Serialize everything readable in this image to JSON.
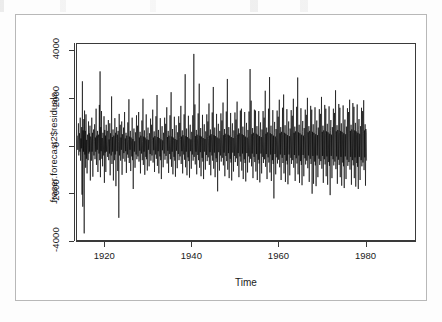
{
  "figure": {
    "background_color": "#ffffff",
    "page_color": "#fdfdfd",
    "border_color": "#b8b8b8",
    "axis_color": "#3a3a3a",
    "series_color": "#000000"
  },
  "chart_data": {
    "type": "line",
    "title": "",
    "subtitle": "",
    "xlabel": "Time",
    "ylabel": "fraser.forecast2$residuals",
    "xlim": [
      1913.5,
      1991.6
    ],
    "ylim": [
      -4000,
      4300
    ],
    "grid": false,
    "legend": null,
    "legend_position": "none",
    "x_ticks": [
      1920,
      1940,
      1960,
      1980
    ],
    "x_tick_labels": [
      "1920",
      "1940",
      "1960",
      "1980"
    ],
    "y_ticks": [
      -4000,
      -2000,
      0,
      2000,
      4000
    ],
    "y_tick_labels": [
      "-4000",
      "-2000",
      "0",
      "2000",
      "4000"
    ],
    "series_name": "fraser.forecast2$residuals",
    "n_points": 938,
    "sampling": "monthly",
    "x_start": 1913.58,
    "x_step": 0.08333,
    "values": [
      420,
      -180,
      260,
      940,
      -420,
      180,
      520,
      -260,
      1180,
      -640,
      300,
      -120,
      780,
      -2080,
      2720,
      -2590,
      640,
      -260,
      1120,
      -3720,
      1480,
      -380,
      620,
      -940,
      1320,
      -560,
      240,
      -1180,
      460,
      180,
      -620,
      1020,
      -340,
      520,
      -260,
      840,
      -1480,
      380,
      220,
      -640,
      1180,
      -260,
      540,
      -1320,
      300,
      680,
      -420,
      160,
      900,
      -580,
      340,
      -260,
      1560,
      -820,
      420,
      -180,
      620,
      -1120,
      280,
      460,
      -340,
      1720,
      -620,
      3140,
      -1340,
      780,
      -240,
      1460,
      -560,
      320,
      -880,
      540,
      200,
      -420,
      1240,
      -1580,
      660,
      -300,
      420,
      -1120,
      880,
      -260,
      340,
      620,
      -480,
      180,
      1080,
      -620,
      260,
      -340,
      940,
      -1260,
      520,
      180,
      -420,
      2080,
      -780,
      360,
      -260,
      680,
      -1480,
      420,
      240,
      -620,
      1160,
      -380,
      540,
      -1720,
      300,
      780,
      -240,
      460,
      -1080,
      620,
      180,
      -3060,
      1340,
      -420,
      260,
      880,
      -640,
      340,
      -180,
      1020,
      -1240,
      480,
      220,
      -560,
      760,
      -320,
      180,
      1420,
      -680,
      300,
      -240,
      540,
      -1160,
      420,
      160,
      -380,
      980,
      -520,
      260,
      1960,
      -740,
      380,
      -180,
      620,
      -1080,
      340,
      220,
      -460,
      1180,
      -620,
      280,
      -1840,
      440,
      720,
      -260,
      180,
      -940,
      560,
      240,
      -380,
      1280,
      -580,
      320,
      840,
      -460,
      200,
      1420,
      -680,
      340,
      -220,
      580,
      -1180,
      420,
      260,
      -340,
      1060,
      -620,
      180,
      1980,
      -820,
      380,
      -260,
      640,
      -1240,
      340,
      200,
      -480,
      1320,
      -580,
      260,
      -1060,
      420,
      760,
      -180,
      240,
      -880,
      520,
      180,
      -360,
      1140,
      -640,
      300,
      880,
      -420,
      220,
      1520,
      -720,
      340,
      -200,
      600,
      -1120,
      400,
      240,
      -380,
      1240,
      -560,
      280,
      2140,
      -860,
      360,
      -240,
      660,
      -1180,
      320,
      200,
      -460,
      1160,
      -620,
      260,
      -1420,
      400,
      820,
      -200,
      220,
      -920,
      540,
      180,
      -340,
      1180,
      -600,
      320,
      920,
      -440,
      240,
      1620,
      -760,
      360,
      -220,
      620,
      -1160,
      420,
      260,
      -360,
      1280,
      -580,
      300,
      2260,
      -900,
      380,
      -260,
      700,
      -1220,
      340,
      220,
      -480,
      1220,
      -640,
      280,
      -1320,
      420,
      860,
      -220,
      240,
      -960,
      560,
      200,
      -360,
      1240,
      -620,
      340,
      960,
      -460,
      260,
      1680,
      -780,
      380,
      -240,
      640,
      -1180,
      440,
      280,
      -380,
      1320,
      -600,
      320,
      3020,
      -920,
      400,
      -260,
      720,
      -1260,
      360,
      240,
      -500,
      1260,
      -660,
      300,
      -1360,
      440,
      880,
      -240,
      260,
      -980,
      580,
      220,
      -380,
      1280,
      -640,
      360,
      3880,
      -480,
      280,
      1740,
      -800,
      400,
      -260,
      660,
      -1220,
      460,
      300,
      -400,
      1360,
      -620,
      340,
      2620,
      -940,
      420,
      -280,
      740,
      -1300,
      380,
      260,
      -520,
      1300,
      -680,
      320,
      -1420,
      460,
      900,
      -260,
      280,
      -1020,
      600,
      240,
      -400,
      1320,
      -660,
      380,
      1020,
      -500,
      300,
      1780,
      -820,
      420,
      -280,
      680,
      -1260,
      480,
      320,
      -420,
      1400,
      -640,
      360,
      2480,
      -980,
      440,
      -300,
      760,
      -1340,
      400,
      280,
      -540,
      1340,
      -700,
      340,
      -1940,
      480,
      920,
      -280,
      300,
      -1060,
      620,
      260,
      -420,
      1360,
      -680,
      400,
      1060,
      -520,
      320,
      1820,
      -840,
      440,
      -300,
      700,
      -1300,
      500,
      340,
      -440,
      1440,
      -660,
      380,
      2820,
      -1020,
      460,
      -320,
      780,
      -1380,
      420,
      300,
      -560,
      1380,
      -720,
      360,
      -1480,
      500,
      940,
      -300,
      320,
      -1100,
      640,
      280,
      -440,
      1400,
      -700,
      420,
      1100,
      -540,
      340,
      1860,
      -860,
      460,
      -320,
      720,
      -1340,
      520,
      360,
      -460,
      1480,
      -680,
      400,
      1560,
      -1060,
      480,
      -340,
      800,
      -1420,
      440,
      320,
      -580,
      1420,
      -740,
      380,
      -1520,
      520,
      960,
      -320,
      340,
      -1140,
      660,
      300,
      -460,
      1440,
      -720,
      440,
      3240,
      -560,
      360,
      1900,
      -880,
      480,
      -340,
      740,
      -1380,
      540,
      380,
      -480,
      1520,
      -700,
      420,
      1480,
      -1100,
      500,
      -360,
      820,
      -1460,
      460,
      340,
      -600,
      1460,
      -760,
      400,
      -1560,
      540,
      980,
      -340,
      360,
      -1180,
      680,
      320,
      -480,
      1460,
      -740,
      460,
      1180,
      -580,
      380,
      2320,
      -900,
      500,
      -360,
      760,
      -1420,
      560,
      400,
      -500,
      1560,
      -720,
      440,
      2900,
      -1140,
      520,
      -380,
      840,
      -1500,
      480,
      360,
      -620,
      1500,
      -780,
      420,
      -2240,
      560,
      1000,
      -360,
      380,
      -1220,
      700,
      340,
      -500,
      1480,
      -760,
      480,
      1220,
      -600,
      400,
      1940,
      -920,
      520,
      -380,
      780,
      -1460,
      580,
      420,
      -520,
      1600,
      -740,
      460,
      2160,
      -1180,
      540,
      -400,
      860,
      -1540,
      500,
      380,
      -640,
      1540,
      -800,
      440,
      -1640,
      580,
      1020,
      -380,
      400,
      -1260,
      720,
      360,
      -520,
      1500,
      -780,
      500,
      1260,
      -620,
      420,
      1980,
      -940,
      540,
      -400,
      800,
      -1500,
      600,
      440,
      -540,
      1640,
      -760,
      480,
      2880,
      -1220,
      560,
      -420,
      880,
      -1580,
      520,
      400,
      -660,
      1580,
      -820,
      460,
      -1680,
      600,
      1040,
      -400,
      420,
      -1300,
      740,
      380,
      -540,
      1520,
      -800,
      520,
      1300,
      -640,
      440,
      2020,
      -960,
      560,
      -420,
      820,
      -1540,
      620,
      460,
      -560,
      1680,
      -780,
      500,
      1520,
      -2040,
      580,
      -440,
      900,
      -1620,
      540,
      420,
      -680,
      1620,
      -840,
      480,
      -1720,
      620,
      1060,
      -420,
      440,
      -1340,
      760,
      400,
      -560,
      1540,
      -820,
      540,
      1340,
      -660,
      460,
      2060,
      -980,
      580,
      -440,
      840,
      -1580,
      640,
      480,
      -580,
      1720,
      -800,
      520,
      1560,
      -1300,
      600,
      -460,
      920,
      -1660,
      560,
      440,
      -700,
      1660,
      -860,
      500,
      -2100,
      640,
      1080,
      -440,
      460,
      -1380,
      780,
      420,
      -580,
      1560,
      -840,
      560,
      1380,
      -680,
      480,
      2340,
      -1000,
      600,
      -460,
      860,
      -1620,
      660,
      500,
      -600,
      1760,
      -820,
      540,
      1600,
      -1340,
      620,
      -480,
      940,
      -1700,
      580,
      460,
      -720,
      1700,
      -880,
      520,
      -1800,
      660,
      1100,
      -460,
      480,
      -1420,
      800,
      440,
      -600,
      1580,
      -860,
      580,
      1420,
      -700,
      500,
      1940,
      -1020,
      620,
      -480,
      880,
      -1660,
      680,
      520,
      -620,
      1800,
      -840,
      560,
      1640,
      -1380,
      640,
      -500,
      960,
      -1740,
      600,
      480,
      -740,
      1740,
      -900,
      540,
      -1840,
      680,
      1120,
      -480,
      500,
      -1460,
      820,
      460,
      -620,
      1600,
      -880,
      600,
      1460,
      -720,
      520,
      1920,
      -1040,
      640,
      -500,
      900,
      -1700,
      700,
      540,
      -640
    ]
  }
}
